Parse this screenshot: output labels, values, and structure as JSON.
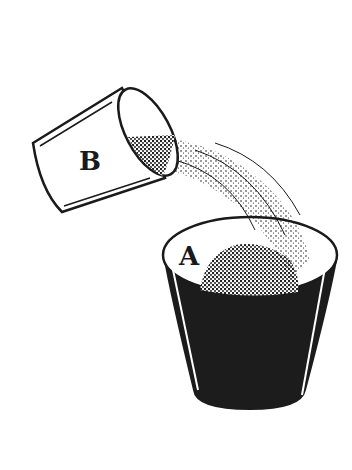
{
  "illustration": {
    "description": "Glass B pouring granular material into glass A",
    "labels": {
      "glass_b": "B",
      "glass_a": "A"
    },
    "colors": {
      "ink": "#1a1a1a",
      "background": "#ffffff"
    }
  }
}
